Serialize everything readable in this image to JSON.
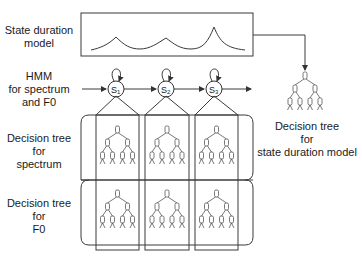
{
  "labels": {
    "duration_model": [
      "State duration",
      "model"
    ],
    "hmm": [
      "HMM",
      "for spectrum",
      "and F0"
    ],
    "tree_spectrum": [
      "Decision tree",
      "for",
      "spectrum"
    ],
    "tree_f0": [
      "Decision tree",
      "for",
      "F0"
    ],
    "tree_duration": [
      "Decision tree",
      "for",
      "state duration model"
    ]
  },
  "states": [
    {
      "id": "S1",
      "label": "S",
      "sub": "1"
    },
    {
      "id": "S2",
      "label": "S",
      "sub": "2"
    },
    {
      "id": "S3",
      "label": "S",
      "sub": "3"
    }
  ],
  "colors": {
    "line": "#3a3a3a",
    "background": "#ffffff",
    "text": "#1a1a1a"
  }
}
